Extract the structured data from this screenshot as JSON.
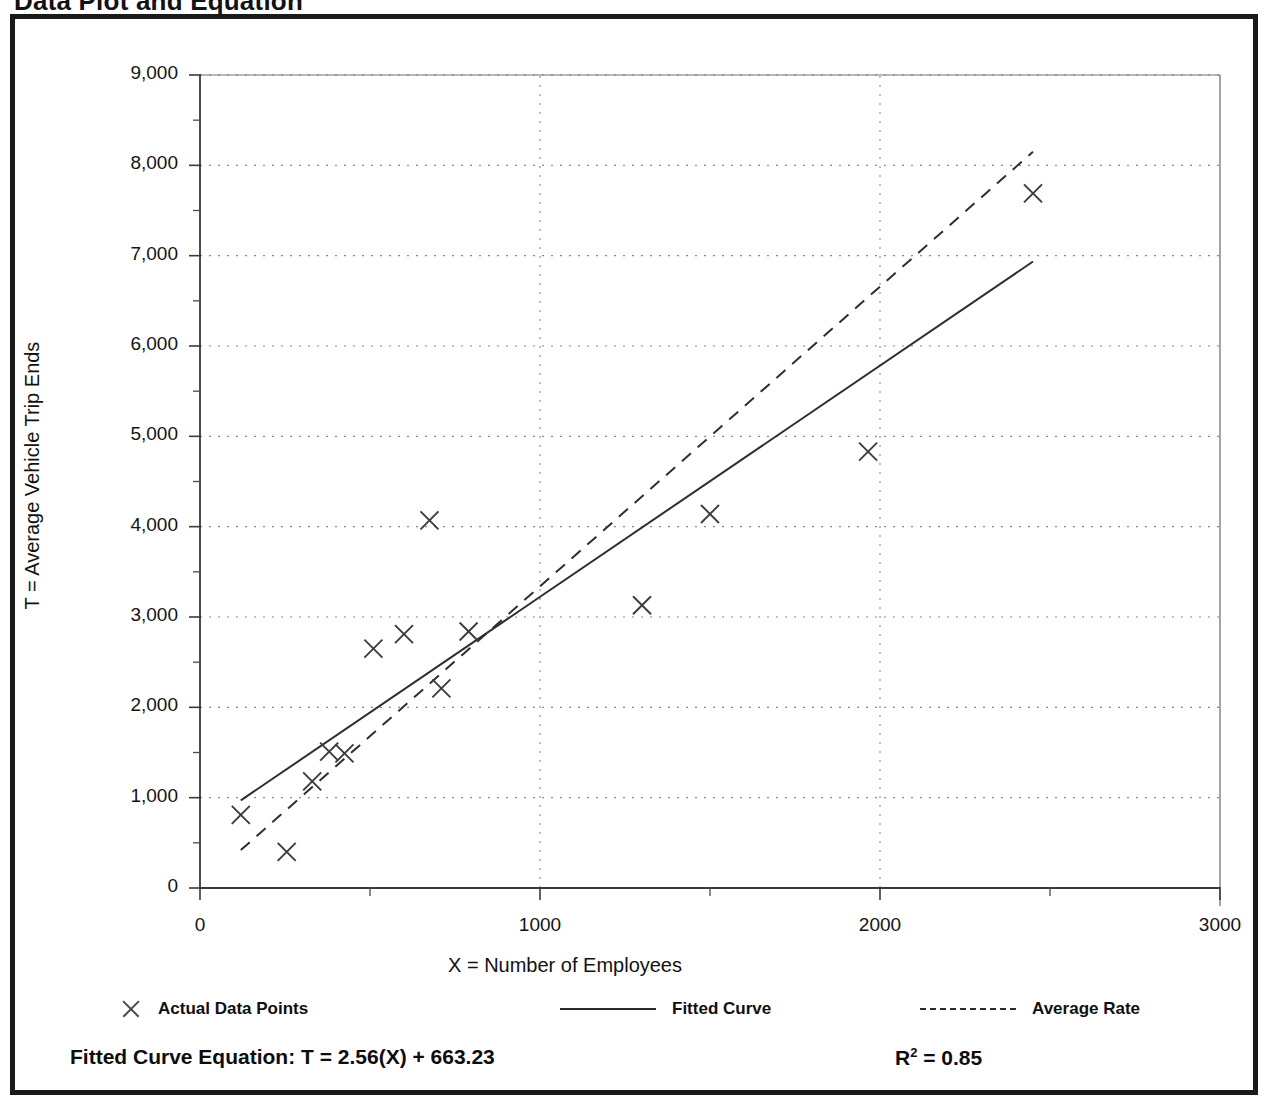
{
  "page": {
    "title": "Data Plot and Equation"
  },
  "chart_data": {
    "type": "scatter",
    "title": "Data Plot and Equation",
    "xlabel": "X = Number of Employees",
    "ylabel": "T = Average Vehicle Trip Ends",
    "xlim": [
      0,
      3000
    ],
    "ylim": [
      0,
      9000
    ],
    "x_major_ticks": [
      0,
      1000,
      2000,
      3000
    ],
    "x_tick_labels": [
      "0",
      "1000",
      "2000",
      "3000"
    ],
    "x_minor_tick_step": 500,
    "y_major_ticks": [
      0,
      1000,
      2000,
      3000,
      4000,
      5000,
      6000,
      7000,
      8000,
      9000
    ],
    "y_tick_labels": [
      "0",
      "1,000",
      "2,000",
      "3,000",
      "4,000",
      "5,000",
      "6,000",
      "7,000",
      "8,000",
      "9,000"
    ],
    "y_minor_tick_step": 500,
    "grid": "dotted horizontal gridlines at every 1,000; dotted vertical gridlines at 1000 and 2000",
    "legend_position": "below-plot",
    "points": [
      {
        "x": 120,
        "y": 810
      },
      {
        "x": 255,
        "y": 400
      },
      {
        "x": 330,
        "y": 1180
      },
      {
        "x": 380,
        "y": 1510
      },
      {
        "x": 425,
        "y": 1490
      },
      {
        "x": 510,
        "y": 2650
      },
      {
        "x": 600,
        "y": 2810
      },
      {
        "x": 675,
        "y": 4070
      },
      {
        "x": 710,
        "y": 2210
      },
      {
        "x": 790,
        "y": 2840
      },
      {
        "x": 1300,
        "y": 3130
      },
      {
        "x": 1500,
        "y": 4140
      },
      {
        "x": 1965,
        "y": 4830
      },
      {
        "x": 2450,
        "y": 7690
      }
    ],
    "series": [
      {
        "name": "Actual Data Points",
        "style": "marker-x",
        "marker": "x"
      },
      {
        "name": "Fitted Curve",
        "style": "solid-line",
        "equation": "T = 2.56(X) + 663.23",
        "slope": 2.56,
        "intercept": 663.23,
        "x_start": 120,
        "y_start": 970,
        "x_end": 2450,
        "y_end": 6935
      },
      {
        "name": "Average Rate",
        "style": "dashed-line",
        "x_start": 120,
        "y_start": 420,
        "x_end": 2450,
        "y_end": 8150
      }
    ],
    "annotations": {
      "fitted_curve_equation": "Fitted Curve Equation:  T = 2.56(X) + 663.23",
      "r_squared": "0.85"
    }
  },
  "legend": {
    "items": [
      {
        "label": "Actual Data Points",
        "marker": "x-marker"
      },
      {
        "label": "Fitted Curve",
        "marker": "solid-line"
      },
      {
        "label": "Average Rate",
        "marker": "dashed-line"
      }
    ]
  },
  "equation": {
    "fitted_label": "Fitted Curve Equation:  T = 2.56(X) + 663.23",
    "r_label": "R",
    "r_exponent": "2",
    "r_value": " = 0.85"
  }
}
